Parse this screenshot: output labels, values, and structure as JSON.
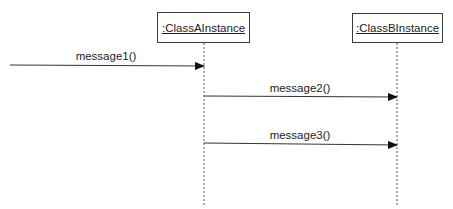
{
  "diagram": {
    "type": "uml-sequence",
    "objects": [
      {
        "id": "a",
        "label": ":ClassAInstance"
      },
      {
        "id": "b",
        "label": ":ClassBInstance"
      }
    ],
    "messages": [
      {
        "label": "message1()",
        "from": "external",
        "to": "a"
      },
      {
        "label": "message2()",
        "from": "a",
        "to": "b"
      },
      {
        "label": "message3()",
        "from": "a",
        "to": "b"
      }
    ]
  }
}
